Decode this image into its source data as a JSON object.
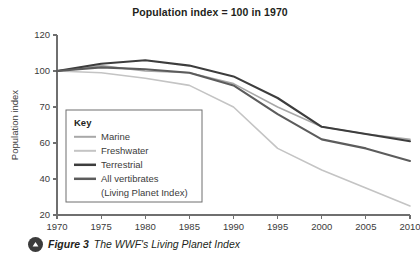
{
  "figure": {
    "caption_marker_icon": "triangle-up-icon",
    "caption_label": "Figure 3",
    "caption_text": "The WWF's Living Planet Index"
  },
  "chart_data": {
    "type": "line",
    "title": "Population index = 100 in 1970",
    "xlabel": "",
    "ylabel": "Population index",
    "xlim": [
      1970,
      2010
    ],
    "ylim": [
      20,
      120
    ],
    "xticks": [
      1970,
      1975,
      1980,
      1985,
      1990,
      1995,
      2000,
      2005,
      2010
    ],
    "yticks": [
      20,
      40,
      60,
      70,
      100,
      120
    ],
    "ytick_values": [
      20,
      40,
      60,
      80,
      100,
      120
    ],
    "grid": false,
    "legend_position": "inside-left",
    "legend_title": "Key",
    "x": [
      1970,
      1975,
      1980,
      1985,
      1990,
      1995,
      2000,
      2005,
      2010
    ],
    "series": [
      {
        "name": "Marine",
        "color": "#a8a8a8",
        "width": 1.6,
        "values": [
          100,
          103,
          100,
          99,
          93,
          80,
          69,
          65,
          62
        ]
      },
      {
        "name": "Freshwater",
        "color": "#c4c4c4",
        "width": 1.6,
        "values": [
          100,
          99,
          96,
          92,
          80,
          57,
          45,
          35,
          25
        ]
      },
      {
        "name": "Terrestrial",
        "color": "#3d3d3d",
        "width": 2.1,
        "values": [
          100,
          104,
          106,
          103,
          97,
          85,
          69,
          65,
          61
        ]
      },
      {
        "name": "All vertibrates",
        "name_line2": "(Living Planet Index)",
        "color": "#5c5c5c",
        "width": 2.1,
        "values": [
          100,
          102,
          101,
          99,
          92,
          76,
          62,
          57,
          50
        ]
      }
    ]
  }
}
